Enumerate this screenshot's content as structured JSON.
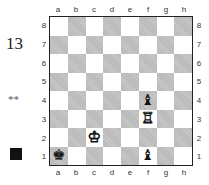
{
  "problem_number": "13",
  "difficulty": "**",
  "side_to_move": "black",
  "files": [
    "a",
    "b",
    "c",
    "d",
    "e",
    "f",
    "g",
    "h"
  ],
  "ranks": [
    "8",
    "7",
    "6",
    "5",
    "4",
    "3",
    "2",
    "1"
  ],
  "pieces": [
    {
      "square": "f4",
      "color": "black",
      "type": "bishop",
      "glyph": "♝"
    },
    {
      "square": "f3",
      "color": "white",
      "type": "rook",
      "glyph": "♖"
    },
    {
      "square": "c2",
      "color": "white",
      "type": "king",
      "glyph": "♔"
    },
    {
      "square": "a1",
      "color": "black",
      "type": "king",
      "glyph": "♚"
    },
    {
      "square": "f1",
      "color": "black",
      "type": "bishop",
      "glyph": "♝"
    }
  ]
}
